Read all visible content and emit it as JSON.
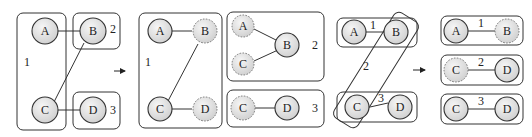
{
  "diagram": {
    "colors": {
      "stroke": "#333333",
      "node_fill_light": "#f4f4f4",
      "node_fill_dark": "#d0d0d0",
      "ghost_stroke": "#777777"
    },
    "panels": [
      {
        "id": "panel-1-before",
        "groups": [
          {
            "label": "1",
            "members": [
              "A",
              "C"
            ]
          },
          {
            "label": "2",
            "members": [
              "B"
            ]
          },
          {
            "label": "3",
            "members": [
              "D"
            ]
          }
        ],
        "nodes": [
          {
            "label": "A",
            "style": "solid"
          },
          {
            "label": "B",
            "style": "solid"
          },
          {
            "label": "C",
            "style": "solid"
          },
          {
            "label": "D",
            "style": "solid"
          }
        ],
        "edges": [
          [
            "A",
            "B"
          ],
          [
            "B",
            "C"
          ],
          [
            "C",
            "D"
          ]
        ]
      },
      {
        "id": "panel-1-after",
        "groups": [
          {
            "label": "1",
            "members": [
              "A",
              "B*",
              "C",
              "D*"
            ]
          },
          {
            "label": "2",
            "members": [
              "A*",
              "B",
              "C*"
            ]
          },
          {
            "label": "3",
            "members": [
              "C*",
              "D"
            ]
          }
        ],
        "nodes": [
          {
            "label": "A",
            "style": "solid"
          },
          {
            "label": "B",
            "style": "dashed"
          },
          {
            "label": "C",
            "style": "solid"
          },
          {
            "label": "D",
            "style": "dashed"
          },
          {
            "label": "A",
            "style": "dashed"
          },
          {
            "label": "B",
            "style": "solid"
          },
          {
            "label": "C",
            "style": "dashed"
          },
          {
            "label": "C",
            "style": "dashed"
          },
          {
            "label": "D",
            "style": "solid"
          }
        ]
      },
      {
        "id": "panel-2-before",
        "groups": [
          {
            "label": "1",
            "members": [
              "A",
              "B"
            ]
          },
          {
            "label": "2",
            "members": [
              "B",
              "C"
            ]
          },
          {
            "label": "3",
            "members": [
              "C",
              "D"
            ]
          }
        ],
        "nodes": [
          {
            "label": "A",
            "style": "solid"
          },
          {
            "label": "B",
            "style": "solid"
          },
          {
            "label": "C",
            "style": "solid"
          },
          {
            "label": "D",
            "style": "solid"
          }
        ],
        "edges": [
          [
            "A",
            "B"
          ],
          [
            "C",
            "D"
          ]
        ]
      },
      {
        "id": "panel-2-after",
        "groups": [
          {
            "label": "1",
            "members": [
              "A",
              "B*"
            ]
          },
          {
            "label": "2",
            "members": [
              "C*",
              "D"
            ]
          },
          {
            "label": "3",
            "members": [
              "C",
              "D"
            ]
          }
        ],
        "nodes": [
          {
            "label": "A",
            "style": "solid"
          },
          {
            "label": "B",
            "style": "dashed"
          },
          {
            "label": "C",
            "style": "dashed"
          },
          {
            "label": "D",
            "style": "solid"
          },
          {
            "label": "C",
            "style": "solid"
          },
          {
            "label": "D",
            "style": "solid"
          }
        ]
      }
    ],
    "labels": {
      "p1": {
        "A": "A",
        "B": "B",
        "C": "C",
        "D": "D",
        "g1": "1",
        "g2": "2",
        "g3": "3"
      },
      "p2": {
        "A": "A",
        "B": "B",
        "C": "C",
        "D": "D",
        "g1": "1",
        "A2": "A",
        "B2": "B",
        "C2": "C",
        "g2": "2",
        "C3": "C",
        "D3": "D",
        "g3": "3"
      },
      "p3": {
        "A": "A",
        "B": "B",
        "C": "C",
        "D": "D",
        "g1": "1",
        "g2": "2",
        "g3": "3"
      },
      "p4": {
        "A": "A",
        "B": "B",
        "g1": "1",
        "C2": "C",
        "D2": "D",
        "g2": "2",
        "C3": "C",
        "D3": "D",
        "g3": "3"
      }
    },
    "arrows": [
      {
        "from": "panel-1-before",
        "to": "panel-1-after"
      },
      {
        "from": "panel-2-before",
        "to": "panel-2-after"
      }
    ]
  }
}
